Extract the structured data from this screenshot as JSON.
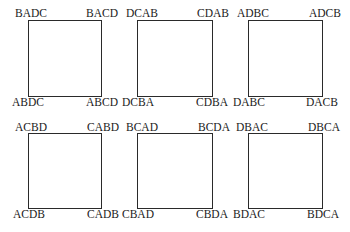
{
  "diagram": {
    "type": "grid-of-squares",
    "rows": 2,
    "cols": 3,
    "squares": [
      {
        "tl": "BADC",
        "tr": "BACD",
        "bl": "ABDC",
        "br": "ABCD"
      },
      {
        "tl": "DCAB",
        "tr": "CDAB",
        "bl": "DCBA",
        "br": "CDBA"
      },
      {
        "tl": "ADBC",
        "tr": "ADCB",
        "bl": "DABC",
        "br": "DACB"
      },
      {
        "tl": "ACBD",
        "tr": "CABD",
        "bl": "ACDB",
        "br": "CADB"
      },
      {
        "tl": "BCAD",
        "tr": "BCDA",
        "bl": "CBAD",
        "br": "CBDA"
      },
      {
        "tl": "DBAC",
        "tr": "DBCA",
        "bl": "BDAC",
        "br": "BDCA"
      }
    ]
  }
}
